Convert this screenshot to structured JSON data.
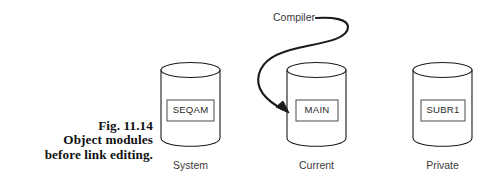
{
  "figure": {
    "caption": {
      "line1": "Fig.  11.14",
      "line2": "Object modules",
      "line3": "before link editing."
    },
    "flow_label": "Compiler",
    "stroke_color": "#1a1a1a",
    "fill_color": "#ffffff",
    "text_color": "#2a2a2a",
    "cylinders": [
      {
        "id": "system",
        "module": "SEQAM",
        "caption": "System",
        "cx": 190.5,
        "top_y": 70,
        "bottom_y": 146,
        "rx": 29.5,
        "ry": 7.5,
        "box_x": 167,
        "box_y": 100,
        "box_w": 47,
        "box_h": 21,
        "caption_y": 159
      },
      {
        "id": "current",
        "module": "MAIN",
        "caption": "Current",
        "cx": 316.5,
        "top_y": 70,
        "bottom_y": 146,
        "rx": 29.5,
        "ry": 7.5,
        "box_x": 296,
        "box_y": 100,
        "box_w": 42,
        "box_h": 21,
        "caption_y": 159
      },
      {
        "id": "private",
        "module": "SUBR1",
        "caption": "Private",
        "cx": 442.5,
        "top_y": 70,
        "bottom_y": 146,
        "rx": 29.5,
        "ry": 7.5,
        "box_x": 421,
        "box_y": 100,
        "box_w": 44,
        "box_h": 21,
        "caption_y": 159
      }
    ],
    "arrow": {
      "label_x": 273,
      "label_y": 11,
      "path": "M 316 18 C 333 17 348 19 348 27 C 348 40 320 43 298 48 C 276 53 263 60 259 74 C 256 85 261 98 284 110",
      "head": "M 289 113 L 276 107 L 283 101 Z"
    }
  }
}
